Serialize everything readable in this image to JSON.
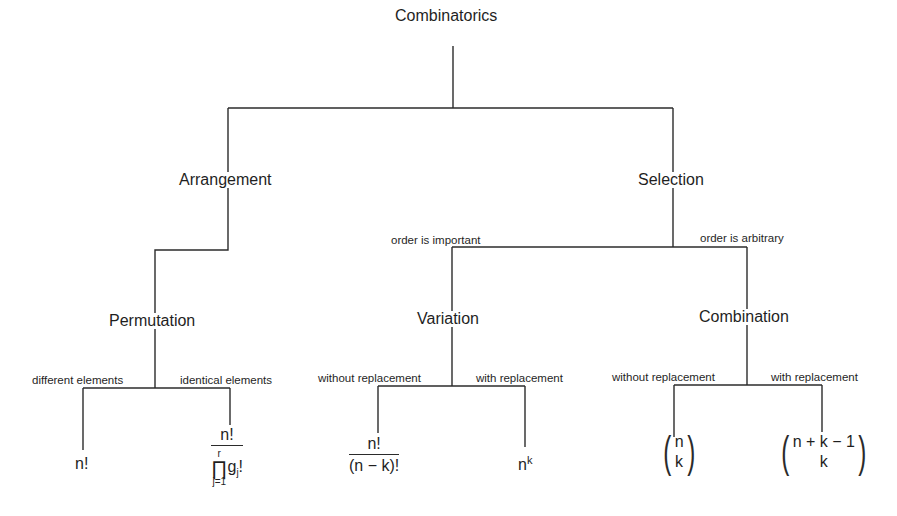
{
  "root": {
    "label": "Combinatorics",
    "x": 386,
    "y": 33
  },
  "nodes": {
    "arrangement": {
      "label": "Arrangement",
      "x": 178,
      "y": 172
    },
    "selection": {
      "label": "Selection",
      "x": 637,
      "y": 172
    },
    "permutation": {
      "label": "Permutation",
      "x": 108,
      "y": 313
    },
    "variation": {
      "label": "Variation",
      "x": 416,
      "y": 311
    },
    "combination": {
      "label": "Combination",
      "x": 698,
      "y": 309
    }
  },
  "edge_labels": {
    "order_important": {
      "label": "order is important",
      "x": 391,
      "y": 235
    },
    "order_arbitrary": {
      "label": "order is arbitrary",
      "x": 700,
      "y": 233
    },
    "different": {
      "label": "different elements",
      "x": 32,
      "y": 375
    },
    "identical": {
      "label": "identical elements",
      "x": 180,
      "y": 375
    },
    "var_without": {
      "label": "without replacement",
      "x": 318,
      "y": 373
    },
    "var_with": {
      "label": "with replacement",
      "x": 476,
      "y": 373
    },
    "comb_without": {
      "label": "without replacement",
      "x": 612,
      "y": 372
    },
    "comb_with": {
      "label": "with replacement",
      "x": 771,
      "y": 372
    }
  },
  "formulas": {
    "permutation_distinct": {
      "text": "n!"
    },
    "permutation_identical": {
      "numerator": "n!",
      "prod_upper": "r",
      "prod_lower": "j=1",
      "prod_symbol": "∏",
      "term": "g",
      "term_sub": "j",
      "term_suffix": "!"
    },
    "variation_without": {
      "numerator": "n!",
      "denominator": "(n − k)!"
    },
    "variation_with": {
      "base": "n",
      "exponent": "k"
    },
    "combination_without": {
      "top": "n",
      "bottom": "k"
    },
    "combination_with": {
      "top": "n + k − 1",
      "bottom": "k"
    }
  },
  "colors": {
    "line": "#2b2b2b",
    "text": "#1f1f1f",
    "background": "#ffffff"
  }
}
